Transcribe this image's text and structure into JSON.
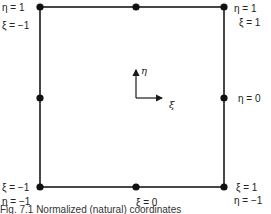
{
  "diagram": {
    "type": "normalized-coordinate-square",
    "colors": {
      "line": "#1a1a1a",
      "node": "#111111"
    },
    "square": {
      "x": 40,
      "y": 7,
      "width": 184,
      "height": 180
    },
    "nodes": [
      {
        "id": "top-left",
        "x": 40,
        "y": 7
      },
      {
        "id": "top-mid",
        "x": 136,
        "y": 7
      },
      {
        "id": "top-right",
        "x": 224,
        "y": 7
      },
      {
        "id": "mid-left",
        "x": 40,
        "y": 98
      },
      {
        "id": "mid-right",
        "x": 224,
        "y": 98
      },
      {
        "id": "bottom-left",
        "x": 40,
        "y": 187
      },
      {
        "id": "bottom-mid",
        "x": 136,
        "y": 187
      },
      {
        "id": "bottom-right",
        "x": 224,
        "y": 187
      }
    ],
    "axes": {
      "eta_label": "η",
      "xi_label": "ξ"
    },
    "labels": {
      "top_left_eta": "η =  1",
      "top_left_xi": "ξ =  −1",
      "top_right_eta": "η =  1",
      "top_right_xi": "ξ =  1",
      "mid_right_eta": "η =  0",
      "bottom_left_xi": "ξ =  −1",
      "bottom_left_eta": "η =  −1",
      "bottom_mid_xi": "ξ =  0",
      "bottom_right_xi": "ξ =  1",
      "bottom_right_eta": "η =  −1"
    },
    "caption": "Fig. 7.1 Normalized (natural) coordinates"
  }
}
